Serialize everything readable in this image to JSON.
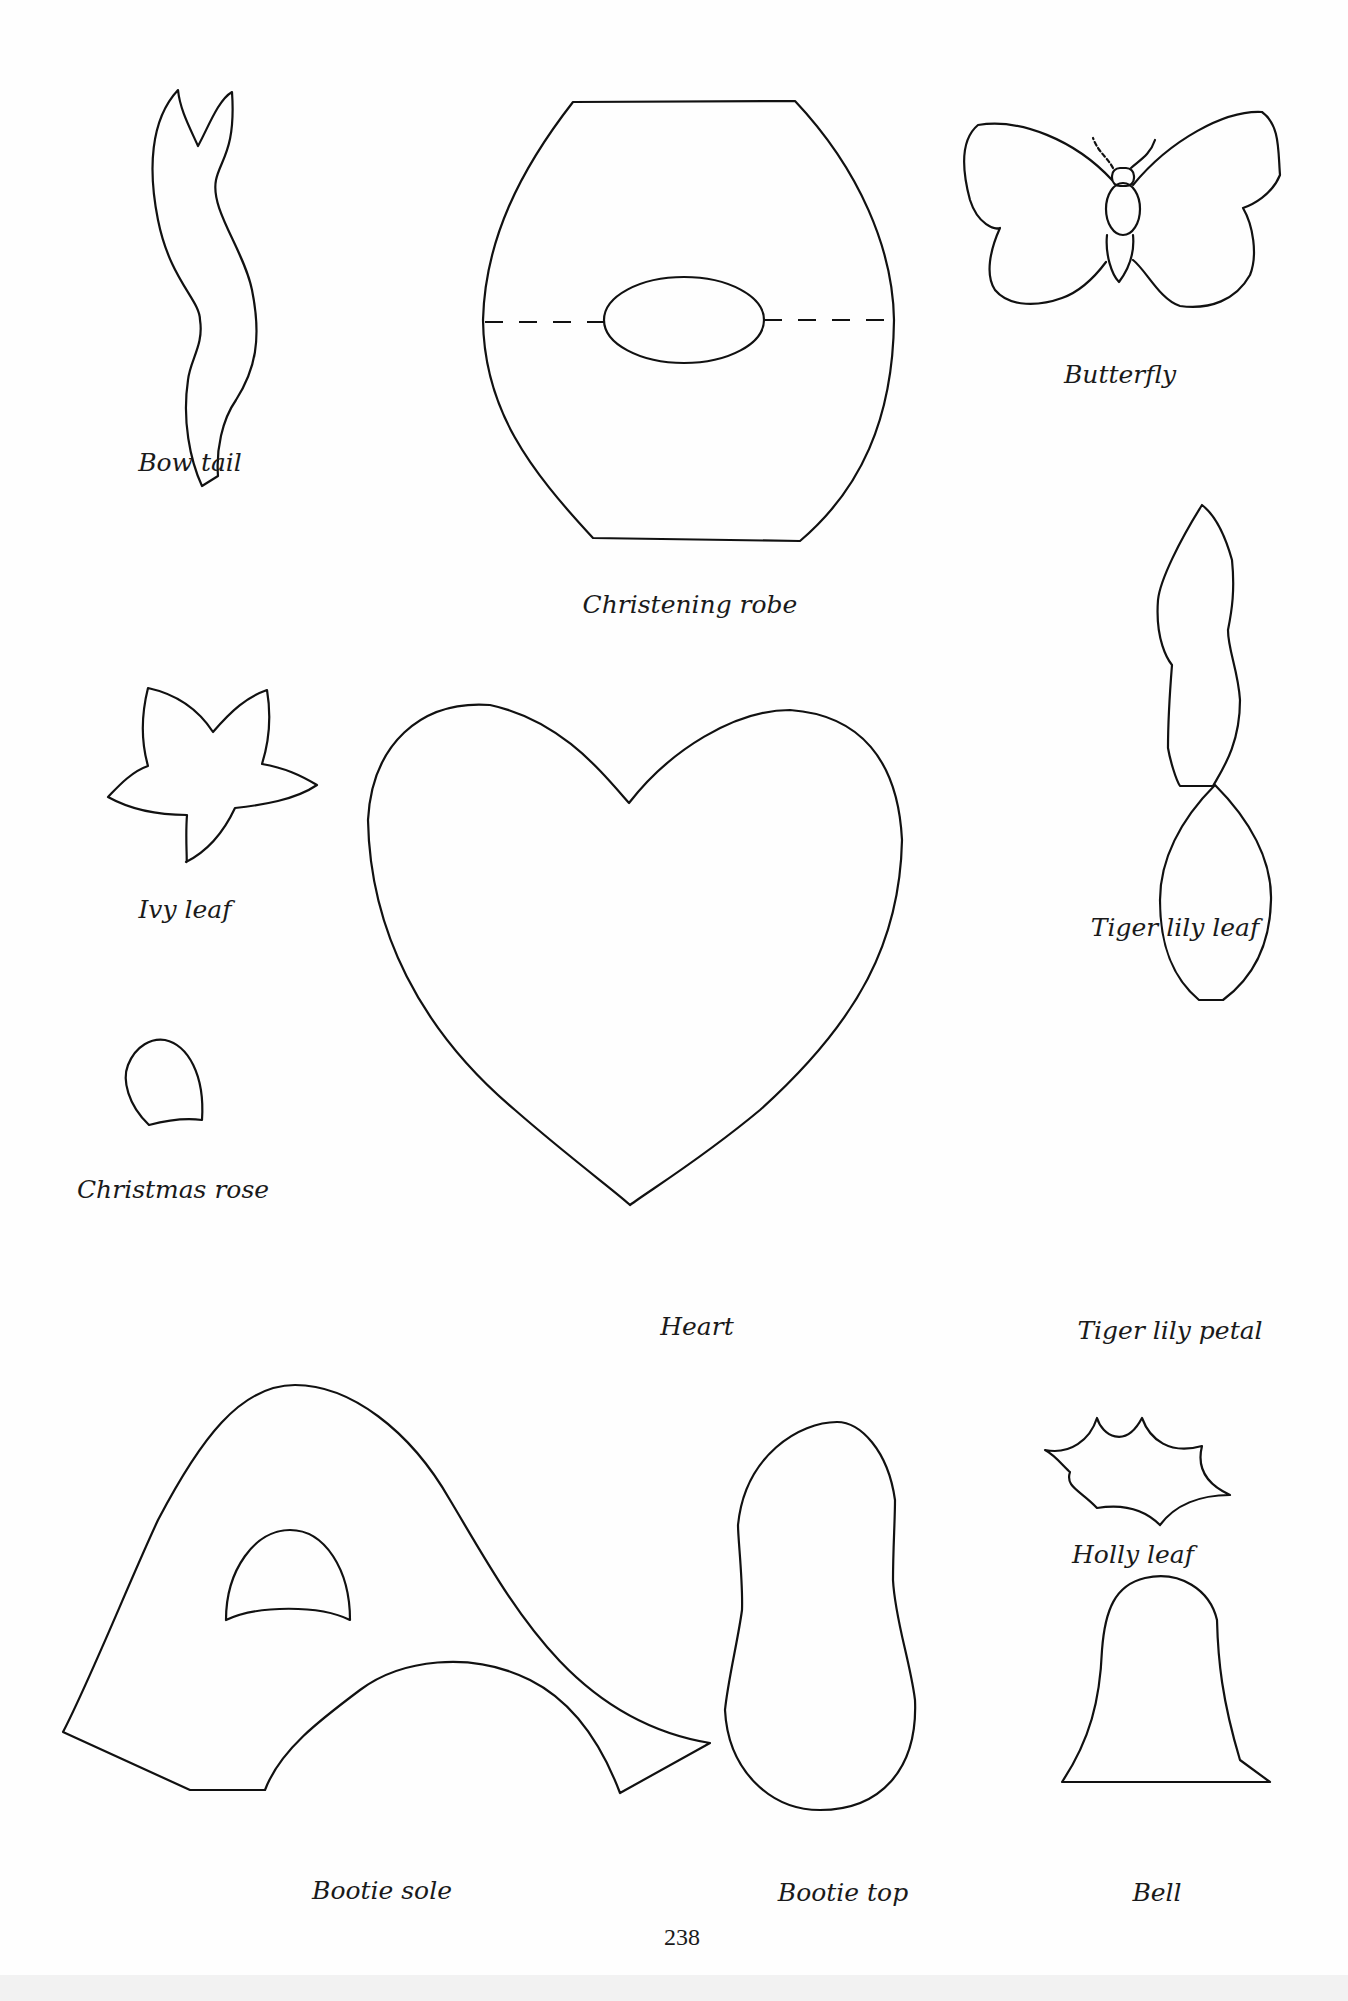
{
  "page": {
    "page_number": "238",
    "background_color": "#fefefe",
    "line_color": "#111111"
  },
  "templates": [
    {
      "id": "bow-tail",
      "label": "Bow tail"
    },
    {
      "id": "christening-robe",
      "label": "Christening robe"
    },
    {
      "id": "butterfly",
      "label": "Butterfly"
    },
    {
      "id": "ivy-leaf",
      "label": "Ivy leaf"
    },
    {
      "id": "heart",
      "label": "Heart"
    },
    {
      "id": "tiger-lily-leaf",
      "label": "Tiger lily leaf"
    },
    {
      "id": "christmas-rose",
      "label": "Christmas rose"
    },
    {
      "id": "tiger-lily-petal",
      "label": "Tiger lily petal"
    },
    {
      "id": "bootie-sole",
      "label": "Bootie sole"
    },
    {
      "id": "bootie-top",
      "label": "Bootie top"
    },
    {
      "id": "holly-leaf",
      "label": "Holly leaf"
    },
    {
      "id": "bell",
      "label": "Bell"
    }
  ]
}
